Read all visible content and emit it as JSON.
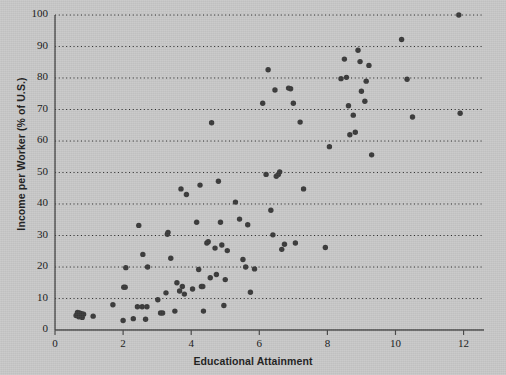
{
  "chart_data": {
    "type": "scatter",
    "title": "",
    "xlabel": "Educational Attainment",
    "ylabel": "Income per Worker (% of U.S.)",
    "xlim": [
      0,
      12.6
    ],
    "ylim": [
      0,
      100
    ],
    "xticks": [
      0,
      2,
      4,
      6,
      8,
      10,
      12
    ],
    "xticklabels": [
      "0",
      "2",
      "4",
      "6",
      "8",
      "10",
      "12"
    ],
    "yticks": [
      0,
      10,
      20,
      30,
      40,
      50,
      60,
      70,
      80,
      90,
      100
    ],
    "yticklabels": [
      "0",
      "10",
      "20",
      "30",
      "40",
      "50",
      "60",
      "70",
      "80",
      "90",
      "100"
    ],
    "grid": "horizontal-dotted",
    "legend": "none",
    "marker_color": "#3a3a3a",
    "axis_color": "#4a4a4a",
    "background_color": "#c9c9c9",
    "points": [
      [
        0.62,
        4.6
      ],
      [
        0.66,
        5.6
      ],
      [
        0.7,
        4.2
      ],
      [
        0.72,
        5.4
      ],
      [
        0.74,
        4.4
      ],
      [
        0.78,
        5.2
      ],
      [
        0.8,
        4.0
      ],
      [
        0.84,
        5.0
      ],
      [
        1.12,
        4.4
      ],
      [
        1.7,
        8.0
      ],
      [
        2.0,
        3.0
      ],
      [
        2.02,
        13.6
      ],
      [
        2.06,
        13.6
      ],
      [
        2.08,
        19.8
      ],
      [
        2.3,
        3.6
      ],
      [
        2.42,
        7.4
      ],
      [
        2.46,
        33.2
      ],
      [
        2.56,
        7.4
      ],
      [
        2.58,
        24.0
      ],
      [
        2.66,
        3.4
      ],
      [
        2.7,
        7.4
      ],
      [
        2.72,
        20.0
      ],
      [
        3.02,
        9.6
      ],
      [
        3.1,
        5.4
      ],
      [
        3.16,
        5.4
      ],
      [
        3.26,
        11.8
      ],
      [
        3.3,
        30.4
      ],
      [
        3.32,
        31.0
      ],
      [
        3.4,
        22.8
      ],
      [
        3.52,
        6.0
      ],
      [
        3.58,
        15.0
      ],
      [
        3.66,
        12.4
      ],
      [
        3.7,
        44.8
      ],
      [
        3.74,
        13.8
      ],
      [
        3.8,
        11.4
      ],
      [
        3.86,
        43.0
      ],
      [
        4.04,
        13.0
      ],
      [
        4.16,
        34.2
      ],
      [
        4.22,
        19.2
      ],
      [
        4.26,
        46.0
      ],
      [
        4.3,
        13.8
      ],
      [
        4.34,
        13.8
      ],
      [
        4.36,
        6.0
      ],
      [
        4.46,
        27.6
      ],
      [
        4.5,
        28.0
      ],
      [
        4.56,
        16.6
      ],
      [
        4.6,
        65.8
      ],
      [
        4.7,
        26.0
      ],
      [
        4.74,
        17.6
      ],
      [
        4.8,
        47.2
      ],
      [
        4.86,
        34.2
      ],
      [
        4.9,
        27.0
      ],
      [
        4.96,
        7.8
      ],
      [
        5.0,
        16.0
      ],
      [
        5.06,
        25.2
      ],
      [
        5.3,
        40.6
      ],
      [
        5.42,
        35.2
      ],
      [
        5.52,
        22.4
      ],
      [
        5.6,
        20.0
      ],
      [
        5.66,
        33.4
      ],
      [
        5.74,
        12.0
      ],
      [
        5.86,
        19.4
      ],
      [
        6.1,
        72.0
      ],
      [
        6.2,
        49.4
      ],
      [
        6.26,
        82.6
      ],
      [
        6.34,
        38.0
      ],
      [
        6.4,
        30.2
      ],
      [
        6.46,
        76.2
      ],
      [
        6.5,
        48.8
      ],
      [
        6.56,
        49.4
      ],
      [
        6.6,
        50.2
      ],
      [
        6.66,
        25.6
      ],
      [
        6.74,
        27.2
      ],
      [
        6.86,
        76.8
      ],
      [
        6.92,
        76.6
      ],
      [
        7.0,
        72.0
      ],
      [
        7.06,
        27.6
      ],
      [
        7.2,
        66.0
      ],
      [
        7.3,
        44.8
      ],
      [
        7.94,
        26.2
      ],
      [
        8.06,
        58.2
      ],
      [
        8.4,
        79.8
      ],
      [
        8.5,
        86.0
      ],
      [
        8.56,
        80.2
      ],
      [
        8.62,
        71.2
      ],
      [
        8.66,
        62.0
      ],
      [
        8.76,
        68.2
      ],
      [
        8.82,
        62.8
      ],
      [
        8.9,
        88.8
      ],
      [
        8.96,
        85.2
      ],
      [
        9.0,
        75.8
      ],
      [
        9.1,
        72.6
      ],
      [
        9.14,
        79.0
      ],
      [
        9.22,
        84.0
      ],
      [
        9.3,
        55.6
      ],
      [
        10.18,
        92.2
      ],
      [
        10.34,
        79.6
      ],
      [
        10.5,
        67.6
      ],
      [
        11.86,
        100.0
      ],
      [
        11.9,
        68.8
      ]
    ]
  },
  "axis": {
    "ylabel_text": "Income per Worker (% of U.S.)",
    "xlabel_text": "Educational Attainment"
  }
}
